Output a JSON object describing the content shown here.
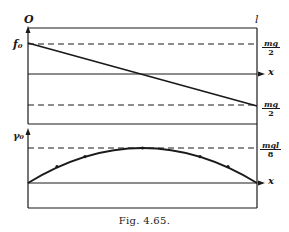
{
  "figure": {
    "caption": "Fig. 4.65.",
    "origin_label": "O",
    "length_label": "l",
    "top_panel": {
      "y_label": "f₀",
      "x_axis_label": "x",
      "upper_value": {
        "num": "mg",
        "den": "2"
      },
      "lower_value": {
        "num": "mg",
        "den": "2"
      },
      "description": "Straight line decreasing from +mg/2 at x=0 to -mg/2 at x=l"
    },
    "bottom_panel": {
      "y_label": "γ₀",
      "x_axis_label": "x",
      "max_value": {
        "num": "mgl",
        "den": "8"
      },
      "description": "Parabola from 0 at x=0 rising to mgl/8 at x=l/2 and returning to 0 at x=l"
    },
    "colors": {
      "ink": "#1a1a1a",
      "paper": "#ffffff"
    }
  }
}
